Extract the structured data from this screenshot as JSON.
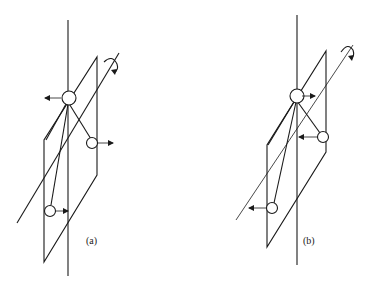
{
  "figure": {
    "panels": [
      {
        "id": "a",
        "label": "(a)",
        "description": "Rotating frame with vertical axis, inclined plane and three balls; top ball pushed left, right ball pushed right, lower-left ball pushed right"
      },
      {
        "id": "b",
        "label": "(b)",
        "description": "Rotating frame with vertical axis, inclined plane and three balls; top ball pushed right, right ball pushed left, lower-left ball pushed left"
      }
    ]
  }
}
